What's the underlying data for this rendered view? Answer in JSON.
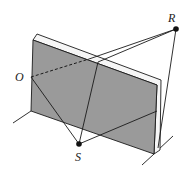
{
  "diagram": {
    "colors": {
      "panel_fill": "#9a9a9a",
      "panel_edge": "#f6f6f6",
      "stroke": "#1a1a1a",
      "background": "#ffffff"
    },
    "points": [
      {
        "id": "O",
        "label": "O",
        "x": 31,
        "y": 77
      },
      {
        "id": "R",
        "label": "R",
        "x": 176,
        "y": 29
      },
      {
        "id": "S",
        "label": "S",
        "x": 79,
        "y": 144
      }
    ],
    "labels": {
      "O": "O",
      "R": "R",
      "S": "S"
    }
  }
}
